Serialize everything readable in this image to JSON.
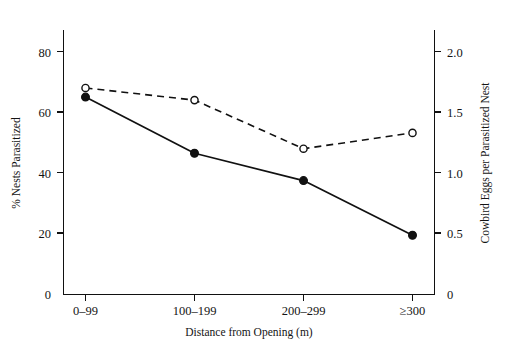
{
  "chart_data": {
    "type": "line",
    "title": "",
    "subtitle": "",
    "xlabel": "Distance from Opening (m)",
    "categories": [
      "0–99",
      "100–199",
      "200–299",
      "≥300"
    ],
    "grid": false,
    "legend": "none",
    "axes": {
      "left": {
        "label": "% Nests Parasitized",
        "ticks": [
          "0",
          "20",
          "40",
          "60",
          "80"
        ],
        "tick_values": [
          0,
          20,
          40,
          60,
          80
        ],
        "ylim": [
          0,
          90
        ]
      },
      "right": {
        "label": "Cowbird Eggs per Parasitized Nest",
        "ticks": [
          "0",
          "0.5",
          "1.0",
          "1.5",
          "2.0"
        ],
        "tick_values": [
          0,
          0.5,
          1.0,
          1.5,
          2.0
        ],
        "ylim": [
          0,
          2.25
        ]
      }
    },
    "series": [
      {
        "name": "% Nests Parasitized",
        "axis": "left",
        "line_style": "solid",
        "marker": "filled-circle",
        "color": "#111111",
        "values": [
          65,
          46.5,
          37.5,
          19.5
        ]
      },
      {
        "name": "Cowbird Eggs per Parasitized Nest",
        "axis": "right",
        "line_style": "dashed",
        "marker": "open-circle",
        "color": "#111111",
        "values": [
          1.7,
          1.6,
          1.2,
          1.33
        ]
      }
    ]
  },
  "figure": {
    "background_color": "#ffffff",
    "ink_color": "#111111"
  }
}
